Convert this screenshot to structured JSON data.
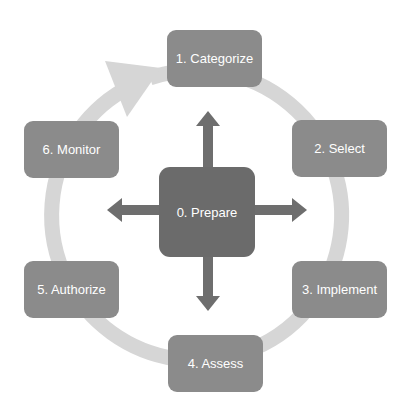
{
  "diagram": {
    "type": "cycle",
    "center_step": {
      "label": "0. Prepare"
    },
    "steps": [
      {
        "label": "1. Categorize"
      },
      {
        "label": "2. Select"
      },
      {
        "label": "3. Implement"
      },
      {
        "label": "4. Assess"
      },
      {
        "label": "5. Authorize"
      },
      {
        "label": "6. Monitor"
      }
    ],
    "colors": {
      "outer_box": "#8b8b8b",
      "center_box": "#6b6b6b",
      "arrows": "#6e6e6e",
      "cycle_ring": "#d6d6d6",
      "text": "#ffffff"
    },
    "icons": {
      "cycle_arrow": "curved-arrow-icon",
      "center_arrows": [
        "arrow-up-icon",
        "arrow-right-icon",
        "arrow-down-icon",
        "arrow-left-icon"
      ]
    }
  }
}
